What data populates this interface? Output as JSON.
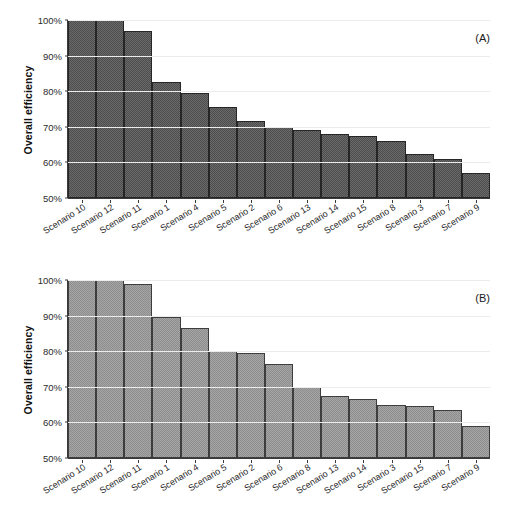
{
  "figure": {
    "panels": [
      {
        "tag": "(A)",
        "ylabel": "Overall efficiency",
        "bar_color": "#4d4d4d"
      },
      {
        "tag": "(B)",
        "ylabel": "Overall efficiency",
        "bar_color": "#8d8d8d"
      }
    ]
  },
  "chart_data": [
    {
      "type": "bar",
      "title": "(A)",
      "xlabel": "",
      "ylabel": "Overall efficiency",
      "ylim": [
        50,
        100
      ],
      "yticks": [
        50,
        60,
        70,
        80,
        90,
        100
      ],
      "ytick_labels": [
        "50%",
        "60%",
        "70%",
        "80%",
        "90%",
        "100%"
      ],
      "grid": true,
      "legend": false,
      "bar_color": "#4d4d4d",
      "categories": [
        "Scenario 10",
        "Scenario 12",
        "Scenario 11",
        "Scenario 1",
        "Scenario 4",
        "Scenario 5",
        "Scenario 2",
        "Scenario 6",
        "Scenario 13",
        "Scenario 14",
        "Scenario 15",
        "Scenario 8",
        "Scenario 3",
        "Scenario 7",
        "Scenario 9"
      ],
      "values": [
        100,
        100,
        97,
        82.5,
        79.5,
        75.5,
        71.5,
        70,
        69,
        68,
        67.5,
        66,
        62.5,
        61,
        57
      ]
    },
    {
      "type": "bar",
      "title": "(B)",
      "xlabel": "",
      "ylabel": "Overall efficiency",
      "ylim": [
        50,
        100
      ],
      "yticks": [
        50,
        60,
        70,
        80,
        90,
        100
      ],
      "ytick_labels": [
        "50%",
        "60%",
        "70%",
        "80%",
        "90%",
        "100%"
      ],
      "grid": true,
      "legend": false,
      "bar_color": "#8d8d8d",
      "categories": [
        "Scenario 10",
        "Scenario 12",
        "Scenario 11",
        "Scenario 1",
        "Scenario 4",
        "Scenario 5",
        "Scenario 2",
        "Scenario 6",
        "Scenario 8",
        "Scenario 13",
        "Scenario 14",
        "Scenario 3",
        "Scenario 15",
        "Scenario 7",
        "Scenario 9"
      ],
      "values": [
        100,
        100,
        99,
        89.5,
        86.5,
        80,
        79.5,
        76.5,
        70,
        67.5,
        66.5,
        65,
        64.5,
        63.5,
        59
      ]
    }
  ]
}
